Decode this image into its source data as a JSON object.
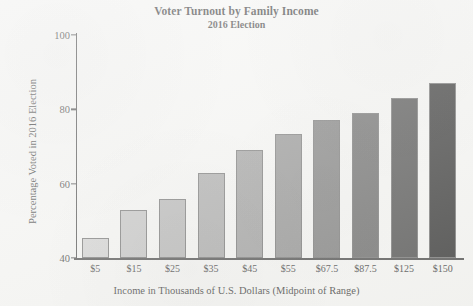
{
  "chart_data": {
    "type": "bar",
    "title": "Voter Turnout by Family Income",
    "subtitle": "2016 Election",
    "xlabel": "Income in Thousands of U.S. Dollars (Midpoint of Range)",
    "ylabel": "Percentage Voted in 2016 Election",
    "categories": [
      "$5",
      "$15",
      "$25",
      "$35",
      "$45",
      "$55",
      "$67.5",
      "$87.5",
      "$125",
      "$150"
    ],
    "values": [
      45.5,
      53,
      56,
      63,
      69,
      73.5,
      77,
      79,
      83,
      87
    ],
    "ylim": [
      40,
      100
    ],
    "yticks": [
      40,
      60,
      80,
      100
    ],
    "ytick_labels": [
      "40",
      "60",
      "80",
      "100"
    ],
    "grid": false,
    "legend": "none",
    "bar_colors": [
      "#c9c9c9",
      "#b9b9b9",
      "#a8a8a8",
      "#9a9a9a",
      "#8c8c8c",
      "#7d7d7d",
      "#656565",
      "#4e4e4e",
      "#2e2e2e",
      "#0d0d0d"
    ],
    "bar_edge_color": "#5a5a5a",
    "axis_color": "#2b2b2b",
    "background_color": "#f4f4f2"
  }
}
